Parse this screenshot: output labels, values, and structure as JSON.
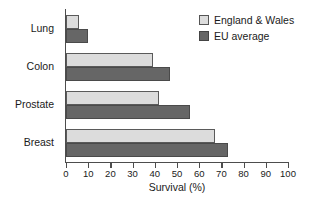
{
  "chart_data": {
    "type": "bar",
    "orientation": "horizontal",
    "title": "",
    "xlabel": "Survival (%)",
    "ylabel": "",
    "categories": [
      "Lung",
      "Colon",
      "Prostate",
      "Breast"
    ],
    "series": [
      {
        "name": "England & Wales",
        "color": "#dcdcdc",
        "values": [
          6,
          39,
          42,
          67
        ]
      },
      {
        "name": "EU average",
        "color": "#666666",
        "values": [
          10,
          47,
          56,
          73
        ]
      }
    ],
    "xlim": [
      0,
      100
    ],
    "xticks": [
      0,
      10,
      20,
      30,
      40,
      50,
      60,
      70,
      80,
      90,
      100
    ],
    "xtick_labels": [
      "0",
      "10",
      "20",
      "30",
      "40",
      "50",
      "60",
      "70",
      "80",
      "90",
      "100"
    ],
    "grid": false,
    "legend_position": "top-right"
  },
  "legend": {
    "items": [
      {
        "label": "England & Wales",
        "swatch": "light"
      },
      {
        "label": "EU average",
        "swatch": "dark"
      }
    ]
  }
}
